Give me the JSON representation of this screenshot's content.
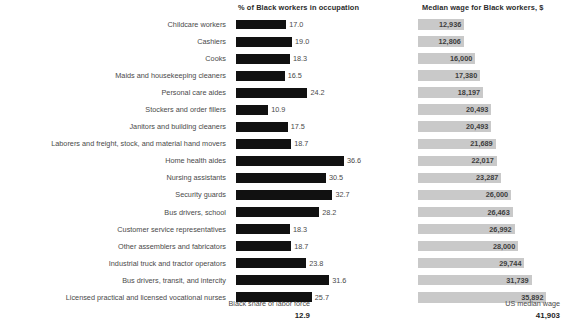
{
  "headers": {
    "left": "% of Black workers in occupation",
    "right": "Median wage for Black workers, $"
  },
  "footer": {
    "left_label": "Black share of labor force",
    "left_value": "12.9",
    "right_label": "US median wage",
    "right_value": "41,903"
  },
  "chart_data": {
    "type": "bar",
    "orientation": "horizontal",
    "grid": false,
    "legend": "none",
    "categories": [
      "Childcare workers",
      "Cashiers",
      "Cooks",
      "Maids and housekeeping cleaners",
      "Personal care aides",
      "Stockers and order fillers",
      "Janitors and building cleaners",
      "Laborers and freight, stock, and material hand movers",
      "Home health aides",
      "Nursing assistants",
      "Security guards",
      "Bus drivers, school",
      "Customer service representatives",
      "Other assemblers and fabricators",
      "Industrial truck and tractor operators",
      "Bus drivers, transit, and intercity",
      "Licensed practical and licensed vocational nurses"
    ],
    "series": [
      {
        "name": "% of Black workers in occupation",
        "xlabel": "",
        "ylabel": "",
        "color": "#111111",
        "xlim": [
          0,
          40
        ],
        "values": [
          17.0,
          19.0,
          18.3,
          16.5,
          24.2,
          10.9,
          17.5,
          18.7,
          36.6,
          30.5,
          32.7,
          28.2,
          18.3,
          18.7,
          23.8,
          31.6,
          25.7
        ],
        "labels": [
          "17.0",
          "19.0",
          "18.3",
          "16.5",
          "24.2",
          "10.9",
          "17.5",
          "18.7",
          "36.6",
          "30.5",
          "32.7",
          "28.2",
          "18.3",
          "18.7",
          "23.8",
          "31.6",
          "25.7"
        ],
        "reference_line": 12.9
      },
      {
        "name": "Median wage for Black workers, $",
        "xlabel": "",
        "ylabel": "",
        "color": "#c9c9c9",
        "xlim": [
          0,
          41903
        ],
        "values": [
          12936,
          12806,
          16000,
          17380,
          18197,
          20493,
          20493,
          21689,
          22017,
          23287,
          26000,
          26463,
          26992,
          28000,
          29744,
          31739,
          35892
        ],
        "labels": [
          "12,936",
          "12,806",
          "16,000",
          "17,380",
          "18,197",
          "20,493",
          "20,493",
          "21,689",
          "22,017",
          "23,287",
          "26,000",
          "26,463",
          "26,992",
          "28,000",
          "29,744",
          "31,739",
          "35,892"
        ],
        "reference_line": 41903
      }
    ]
  }
}
